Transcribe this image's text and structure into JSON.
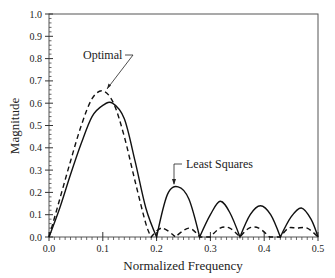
{
  "chart_data": {
    "type": "line",
    "title": "",
    "xlabel": "Normalized Frequency",
    "ylabel": "Magnitude",
    "xlim": [
      0.0,
      0.5
    ],
    "ylim": [
      0.0,
      1.0
    ],
    "xticks": [
      "0.0",
      "0.1",
      "0.2",
      "0.3",
      "0.4",
      "0.5"
    ],
    "yticks": [
      "0.0",
      "0.1",
      "0.2",
      "0.3",
      "0.4",
      "0.5",
      "0.6",
      "0.7",
      "0.8",
      "0.9",
      "1.0"
    ],
    "grid": false,
    "legend": "annotations",
    "annotations": [
      {
        "text": "Optimal",
        "target_series": "Optimal"
      },
      {
        "text": "Least Squares",
        "target_series": "Least Squares"
      }
    ],
    "series": [
      {
        "name": "Optimal",
        "style": "dashed",
        "x": [
          0.0,
          0.02,
          0.04,
          0.06,
          0.08,
          0.1,
          0.12,
          0.14,
          0.16,
          0.18,
          0.19,
          0.21,
          0.235,
          0.26,
          0.28,
          0.3,
          0.318,
          0.336,
          0.355,
          0.372,
          0.39,
          0.41,
          0.43,
          0.445,
          0.46,
          0.48,
          0.5
        ],
        "values": [
          0.0,
          0.17,
          0.34,
          0.5,
          0.62,
          0.655,
          0.6,
          0.45,
          0.25,
          0.06,
          0.0,
          0.04,
          0.0,
          0.04,
          0.0,
          0.0,
          0.04,
          0.04,
          0.0,
          0.04,
          0.04,
          0.0,
          0.0,
          0.04,
          0.04,
          0.04,
          0.0
        ]
      },
      {
        "name": "Least Squares",
        "style": "solid",
        "x": [
          0.0,
          0.02,
          0.04,
          0.06,
          0.08,
          0.1,
          0.118,
          0.14,
          0.16,
          0.18,
          0.2,
          0.22,
          0.24,
          0.26,
          0.28,
          0.3,
          0.318,
          0.336,
          0.355,
          0.374,
          0.393,
          0.412,
          0.43,
          0.45,
          0.469,
          0.487,
          0.5
        ],
        "values": [
          0.0,
          0.13,
          0.28,
          0.42,
          0.54,
          0.59,
          0.6,
          0.53,
          0.34,
          0.13,
          0.0,
          0.19,
          0.225,
          0.17,
          0.0,
          0.1,
          0.16,
          0.11,
          0.0,
          0.1,
          0.14,
          0.1,
          0.0,
          0.09,
          0.13,
          0.08,
          0.0
        ]
      }
    ]
  }
}
